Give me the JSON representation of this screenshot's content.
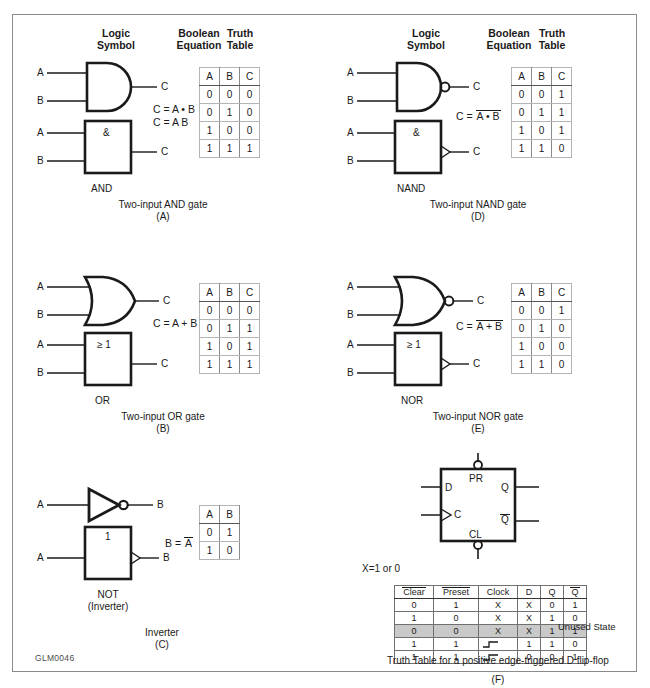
{
  "figure": {
    "code": "GLM0046",
    "frame_color": "#8a8a8a"
  },
  "column_headers": {
    "logic_symbol_line1": "Logic",
    "logic_symbol_line2": "Symbol",
    "boolean_line1": "Boolean",
    "boolean_line2": "Equation",
    "truth_line1": "Truth",
    "truth_line2": "Table"
  },
  "sections": {
    "and": {
      "input_a": "A",
      "input_b": "B",
      "output_c": "C",
      "iec_label": "&",
      "iec_name": "AND",
      "equation_1": "C = A • B",
      "equation_2": "C = A B",
      "caption": "Two-input AND gate",
      "letter": "(A)",
      "table": {
        "headers": [
          "A",
          "B",
          "C"
        ],
        "rows": [
          [
            "0",
            "0",
            "0"
          ],
          [
            "0",
            "1",
            "0"
          ],
          [
            "1",
            "0",
            "0"
          ],
          [
            "1",
            "1",
            "1"
          ]
        ]
      }
    },
    "nand": {
      "input_a": "A",
      "input_b": "B",
      "output_c": "C",
      "iec_label": "&",
      "iec_name": "NAND",
      "equation_prefix": "C = ",
      "equation_bar": "A • B",
      "caption": "Two-input NAND gate",
      "letter": "(D)",
      "table": {
        "headers": [
          "A",
          "B",
          "C"
        ],
        "rows": [
          [
            "0",
            "0",
            "1"
          ],
          [
            "0",
            "1",
            "1"
          ],
          [
            "1",
            "0",
            "1"
          ],
          [
            "1",
            "1",
            "0"
          ]
        ]
      }
    },
    "or": {
      "input_a": "A",
      "input_b": "B",
      "output_c": "C",
      "iec_label": "≥ 1",
      "iec_name": "OR",
      "equation_1": "C = A + B",
      "caption": "Two-input OR gate",
      "letter": "(B)",
      "table": {
        "headers": [
          "A",
          "B",
          "C"
        ],
        "rows": [
          [
            "0",
            "0",
            "0"
          ],
          [
            "0",
            "1",
            "1"
          ],
          [
            "1",
            "0",
            "1"
          ],
          [
            "1",
            "1",
            "1"
          ]
        ]
      }
    },
    "nor": {
      "input_a": "A",
      "input_b": "B",
      "output_c": "C",
      "iec_label": "≥ 1",
      "iec_name": "NOR",
      "equation_prefix": "C = ",
      "equation_bar": "A + B",
      "caption": "Two-input NOR gate",
      "letter": "(E)",
      "table": {
        "headers": [
          "A",
          "B",
          "C"
        ],
        "rows": [
          [
            "0",
            "0",
            "1"
          ],
          [
            "0",
            "1",
            "0"
          ],
          [
            "1",
            "0",
            "0"
          ],
          [
            "1",
            "1",
            "0"
          ]
        ]
      }
    },
    "not": {
      "input_a": "A",
      "output_b": "B",
      "iec_label": "1",
      "iec_name_line1": "NOT",
      "iec_name_line2": "(Inverter)",
      "equation_prefix": "B = ",
      "equation_bar": "A",
      "caption": "Inverter",
      "letter": "(C)",
      "table": {
        "headers": [
          "A",
          "B"
        ],
        "rows": [
          [
            "0",
            "1"
          ],
          [
            "1",
            "0"
          ]
        ]
      }
    },
    "flipflop": {
      "preset_pin": "PR",
      "clear_pin": "CL",
      "data_pin": "D",
      "clock_pin": "C",
      "q_pin": "Q",
      "qbar_pin": "Q",
      "note": "X=1 or 0",
      "unused_label": "Unused State",
      "caption": "Truth Table for a positive edge-triggered D flip-flop",
      "letter": "(F)",
      "table": {
        "headers": [
          "Clear",
          "Preset",
          "Clock",
          "D",
          "Q",
          "Q"
        ],
        "headers_overbar": [
          true,
          true,
          false,
          false,
          false,
          true
        ],
        "rows": [
          {
            "cells": [
              "0",
              "1",
              "X",
              "X",
              "0",
              "1"
            ],
            "clock": "X",
            "highlight": false
          },
          {
            "cells": [
              "1",
              "0",
              "X",
              "X",
              "1",
              "0"
            ],
            "clock": "X",
            "highlight": false
          },
          {
            "cells": [
              "0",
              "0",
              "X",
              "X",
              "1",
              "1"
            ],
            "clock": "X",
            "highlight": true
          },
          {
            "cells": [
              "1",
              "1",
              "EDGE",
              "1",
              "1",
              "0"
            ],
            "clock": "EDGE",
            "highlight": false
          },
          {
            "cells": [
              "1",
              "1",
              "EDGE",
              "0",
              "0",
              "1"
            ],
            "clock": "EDGE",
            "highlight": false
          }
        ]
      }
    }
  }
}
